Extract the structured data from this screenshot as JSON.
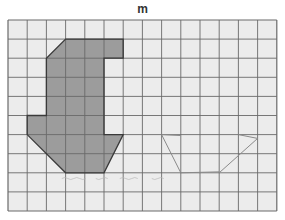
{
  "title": "m",
  "grid": {
    "cols": 14,
    "rows": 10,
    "origin_x": 8,
    "origin_y": 20,
    "cell_w": 19.2,
    "cell_h": 19.1,
    "background": "#ececec",
    "line_color": "#6a6a6a"
  },
  "shaded_shape": {
    "fill": "#9c9c9c",
    "stroke": "#3a3a3a",
    "vertices": [
      [
        3,
        1
      ],
      [
        6,
        1
      ],
      [
        6,
        2
      ],
      [
        5,
        2
      ],
      [
        5,
        6
      ],
      [
        6,
        6
      ],
      [
        5,
        8
      ],
      [
        3,
        8
      ],
      [
        1,
        6
      ],
      [
        1,
        5
      ],
      [
        2,
        5
      ],
      [
        2,
        2
      ]
    ]
  },
  "drawn_outline": {
    "stroke": "#8a8a8a",
    "segments": [
      [
        [
          8,
          6
        ],
        [
          9,
          6.05
        ]
      ],
      [
        [
          8,
          6
        ],
        [
          9,
          8
        ]
      ],
      [
        [
          9,
          8
        ],
        [
          11,
          7.95
        ]
      ],
      [
        [
          11,
          8
        ],
        [
          13,
          6.2
        ]
      ],
      [
        [
          12,
          6
        ],
        [
          13,
          6.2
        ]
      ]
    ]
  },
  "scribbles": {
    "stroke": "#b8b8b8",
    "y": 8.3,
    "x_start": 2.8,
    "x_end": 7.4
  }
}
